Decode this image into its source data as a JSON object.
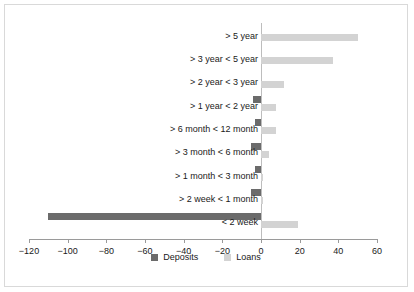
{
  "chart_data": {
    "type": "bar",
    "orientation": "horizontal",
    "title": "",
    "subtitle": "",
    "xlabel": "",
    "ylabel": "",
    "xlim": [
      -120,
      60
    ],
    "xticks": [
      -120,
      -100,
      -80,
      -60,
      -40,
      -20,
      0,
      20,
      40,
      60
    ],
    "xtick_labels": [
      "−120",
      "−100",
      "−80",
      "−60",
      "−40",
      "−20",
      "0",
      "20",
      "40",
      "60"
    ],
    "grid": false,
    "legend_position": "bottom",
    "categories": [
      "> 5 year",
      "> 3 year < 5 year",
      "> 2 year < 3 year",
      "> 1 year < 2 year",
      "> 6 month < 12 month",
      "> 3 month < 6 month",
      "> 1 month < 3 month",
      "> 2 week < 1 month",
      "< 2 week"
    ],
    "series": [
      {
        "name": "Deposits",
        "color": "#6b6b6b",
        "values": [
          0,
          0,
          0,
          -4,
          -3,
          -5,
          -3,
          -5,
          -110
        ]
      },
      {
        "name": "Loans",
        "color": "#d3d3d3",
        "values": [
          50,
          37,
          12,
          8,
          8,
          4,
          0.5,
          0.5,
          19
        ]
      }
    ]
  },
  "legend": {
    "items": [
      {
        "label": "Deposits",
        "color": "#6b6b6b"
      },
      {
        "label": "Loans",
        "color": "#d3d3d3"
      }
    ]
  },
  "colors": {
    "deposits": "#6b6b6b",
    "loans": "#d3d3d3",
    "axis": "#9a9a9a",
    "border": "#d9d9d9",
    "text": "#1a1a1a"
  }
}
